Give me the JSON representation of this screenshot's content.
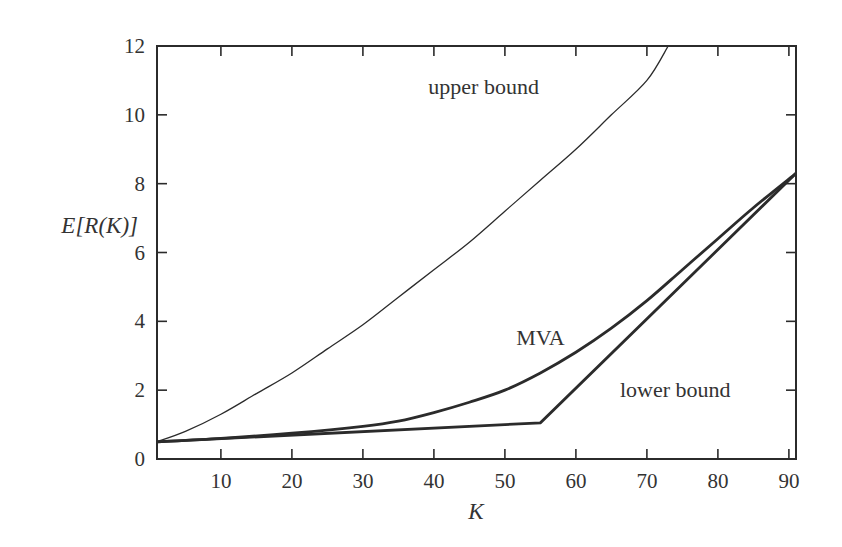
{
  "chart_data": {
    "type": "line",
    "title": "",
    "xlabel": "K",
    "ylabel": "E[R(K)]",
    "xlim": [
      1,
      91
    ],
    "ylim": [
      0,
      12
    ],
    "x_ticks": [
      10,
      20,
      30,
      40,
      50,
      60,
      70,
      80,
      90
    ],
    "y_ticks": [
      0,
      2,
      4,
      6,
      8,
      10,
      12
    ],
    "grid": false,
    "legend": null,
    "series": [
      {
        "name": "upper bound",
        "style": "thin",
        "x": [
          1,
          5,
          10,
          15,
          20,
          25,
          30,
          35,
          40,
          45,
          50,
          55,
          60,
          65,
          70,
          73
        ],
        "y": [
          0.5,
          0.8,
          1.3,
          1.9,
          2.5,
          3.2,
          3.9,
          4.7,
          5.5,
          6.3,
          7.2,
          8.1,
          9.0,
          10.0,
          11.0,
          12.0
        ]
      },
      {
        "name": "MVA",
        "style": "thick",
        "x": [
          1,
          10,
          20,
          30,
          35,
          40,
          45,
          50,
          55,
          60,
          65,
          70,
          75,
          80,
          85,
          91
        ],
        "y": [
          0.5,
          0.6,
          0.75,
          0.95,
          1.1,
          1.35,
          1.65,
          2.0,
          2.5,
          3.1,
          3.8,
          4.6,
          5.5,
          6.4,
          7.3,
          8.3
        ]
      },
      {
        "name": "lower bound",
        "style": "thick",
        "x": [
          1,
          55,
          91
        ],
        "y": [
          0.5,
          1.05,
          8.3
        ]
      }
    ],
    "annotations": [
      {
        "text": "upper bound",
        "x": 47,
        "y": 10.6
      },
      {
        "text": "MVA",
        "x": 55,
        "y": 3.3
      },
      {
        "text": "lower bound",
        "x": 74,
        "y": 1.8
      }
    ]
  }
}
